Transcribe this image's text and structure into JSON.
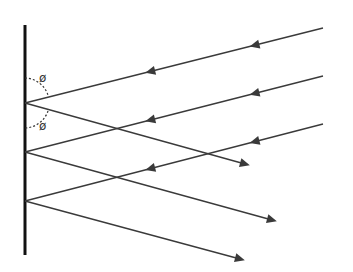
{
  "diagram": {
    "angle_label_top": "ø",
    "angle_label_bottom": "ø",
    "colors": {
      "line": "#3a3a3a",
      "wall": "#111111",
      "background": "#ffffff"
    },
    "wall": {
      "x": 25,
      "y1": 25,
      "y2": 255
    },
    "rays": [
      {
        "name": "ray-1",
        "start": [
          323,
          28
        ],
        "hit": [
          25,
          103
        ],
        "end": [
          245,
          164
        ]
      },
      {
        "name": "ray-2",
        "start": [
          323,
          76
        ],
        "hit": [
          25,
          152
        ],
        "end": [
          272,
          220
        ]
      },
      {
        "name": "ray-3",
        "start": [
          323,
          124
        ],
        "hit": [
          25,
          201
        ],
        "end": [
          240,
          259
        ]
      }
    ]
  }
}
